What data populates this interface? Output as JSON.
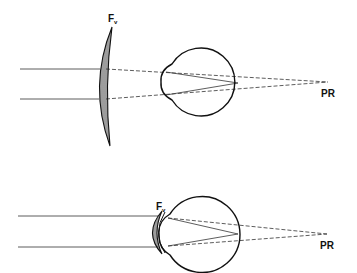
{
  "diagram": {
    "colors": {
      "ink": "#111111",
      "ray": "#333333",
      "hatch": "#222222",
      "background": "#ffffff"
    },
    "panels": [
      {
        "id": "spectacle-lens",
        "lens_label": {
          "main": "F",
          "sub": "v",
          "x": 109,
          "y": 14
        },
        "far_point_label": {
          "text": "PR",
          "x": 322,
          "y": 90
        },
        "far_point": [
          328,
          82
        ],
        "eye": {
          "cx": 205,
          "cy": 82,
          "r": 34,
          "cornea_x": 162
        },
        "incident_rays_y": [
          69,
          99
        ],
        "ray_start_x": 20,
        "lens": {
          "x_front": 96,
          "x_back": 110,
          "top": 27,
          "bottom": 146
        },
        "retina_point": [
          238,
          82
        ]
      },
      {
        "id": "contact-lens",
        "lens_label": {
          "main": "F",
          "sub": "v",
          "x": 157,
          "y": 203
        },
        "far_point_label": {
          "text": "PR",
          "x": 320,
          "y": 242
        },
        "far_point": [
          327,
          234
        ],
        "eye": {
          "cx": 201,
          "cy": 235,
          "r": 38,
          "cornea_x": 159
        },
        "incident_rays_y": [
          216,
          247
        ],
        "ray_start_x": 18,
        "lens": {
          "x_front": 151,
          "x_back": 160,
          "top": 212,
          "bottom": 252
        },
        "retina_point": [
          238,
          234
        ]
      }
    ]
  }
}
